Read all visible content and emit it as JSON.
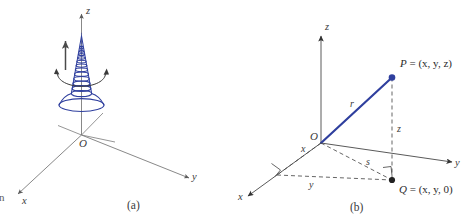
{
  "figure": {
    "colors": {
      "curve_blue": "#2f3f9e",
      "axis_gray": "#6b6b6b",
      "text_dark": "#2b2b2b",
      "background": "#ffffff"
    },
    "edge_fragment": "n",
    "panels": [
      {
        "id": "a",
        "caption": "(a)",
        "axes": [
          {
            "name": "z",
            "label": "z"
          },
          {
            "name": "y",
            "label": "y"
          },
          {
            "name": "x",
            "label": "x"
          }
        ],
        "origin_label": "O",
        "curve": "conical-helix",
        "annotations": {
          "rotation": "revolution-arrow",
          "translation": "up-arrow"
        }
      },
      {
        "id": "b",
        "caption": "(b)",
        "axes": [
          {
            "name": "z",
            "label": "z"
          },
          {
            "name": "y",
            "label": "y"
          },
          {
            "name": "x",
            "label": "x"
          }
        ],
        "origin_label": "O",
        "points": [
          {
            "name": "P",
            "label_lead": "P",
            "label_rest": " = (x, y, z)"
          },
          {
            "name": "Q",
            "label_lead": "Q",
            "label_rest": " = (x, y, 0)"
          }
        ],
        "segments": [
          {
            "name": "r",
            "label": "r"
          },
          {
            "name": "s",
            "label": "s"
          },
          {
            "name": "z",
            "label": "z"
          },
          {
            "name": "y",
            "label": "y"
          },
          {
            "name": "x",
            "label": "x"
          }
        ],
        "right_angles": 2
      }
    ]
  }
}
